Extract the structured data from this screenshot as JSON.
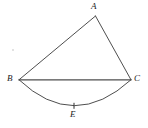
{
  "figure": {
    "kind": "geometry-diagram",
    "background_color": "#ffffff",
    "stroke_color": "#3a3a3a",
    "chord_color": "#555555",
    "label_color": "#1b1b1b"
  },
  "points": {
    "A": {
      "label": "A",
      "x": 95.5,
      "y": 16.0
    },
    "B": {
      "label": "B",
      "x": 19.0,
      "y": 79.8
    },
    "C": {
      "label": "C",
      "x": 131.0,
      "y": 79.8
    },
    "E": {
      "label": "E",
      "x": 74.0,
      "y": 105.8
    }
  },
  "segments": [
    {
      "name": "segment-BA",
      "from": "B",
      "to": "A"
    },
    {
      "name": "segment-AC",
      "from": "A",
      "to": "C"
    },
    {
      "name": "segment-BC",
      "from": "B",
      "to": "C"
    }
  ],
  "arcs": [
    {
      "name": "arc-BEC",
      "from": "B",
      "through": "E",
      "to": "C",
      "sagitta": 26.0,
      "bulge": "below"
    }
  ],
  "ticks": [
    {
      "name": "tick-E",
      "on": "arc-BEC",
      "at": "E",
      "x": 74.0,
      "y": 105.8,
      "length": 6
    }
  ],
  "marks": [
    {
      "name": "speck-left",
      "x": 12,
      "y": 49
    }
  ]
}
